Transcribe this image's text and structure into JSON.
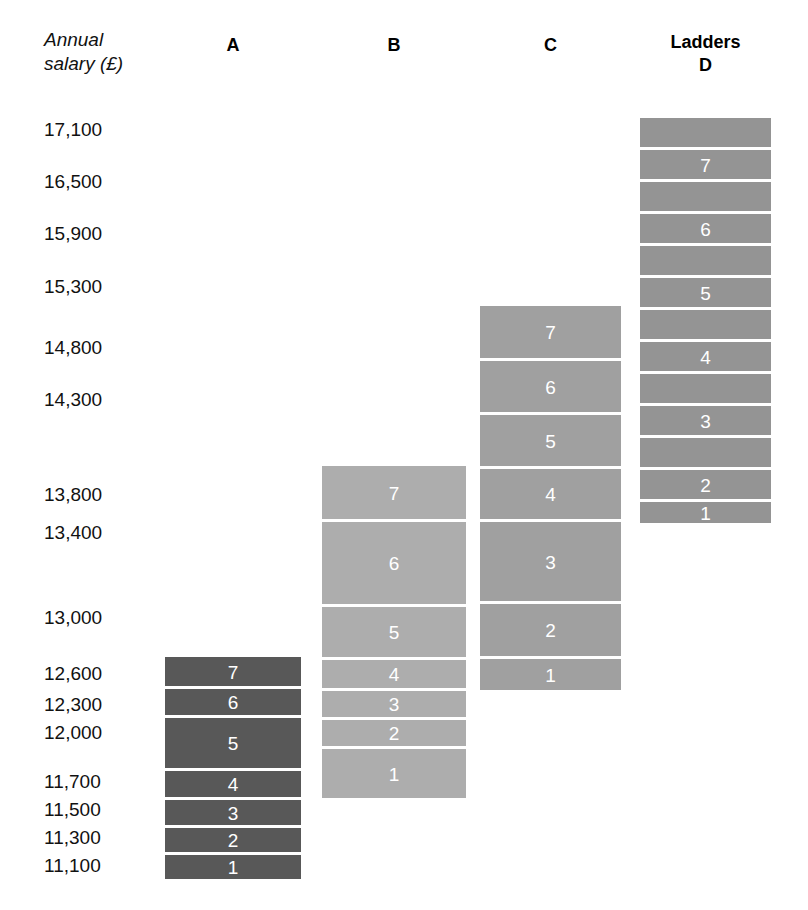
{
  "axis": {
    "title": "Annual\nsalary (£)",
    "tick_labels": [
      "17,100",
      "16,500",
      "15,900",
      "15,300",
      "14,800",
      "14,300",
      "13,800",
      "13,400",
      "13,000",
      "12,600",
      "12,300",
      "12,000",
      "11,700",
      "11,500",
      "11,300",
      "11,100"
    ]
  },
  "headers": {
    "a": "A",
    "b": "B",
    "c": "C",
    "d_top": "Ladders",
    "d_bottom": "D"
  },
  "colors": {
    "ladder_a": "#585858",
    "ladder_b": "#adadad",
    "ladder_c": "#a0a0a0",
    "ladder_d": "#949494",
    "gap": "#ffffff",
    "rung_text": "#ffffff",
    "axis_text": "#111111"
  },
  "chart_data": {
    "type": "bar",
    "title": "",
    "subtitle": "",
    "xlabel": "Ladders",
    "ylabel": "Annual salary (£)",
    "grid": false,
    "legend": "none",
    "ylim": [
      10950,
      17400
    ],
    "ytick_values": [
      17100,
      16500,
      15900,
      15300,
      14800,
      14300,
      13800,
      13400,
      13000,
      12600,
      12300,
      12000,
      11700,
      11500,
      11300,
      11100
    ],
    "ytick_labels": [
      "17,100",
      "16,500",
      "15,900",
      "15,300",
      "14,800",
      "14,300",
      "13,800",
      "13,400",
      "13,000",
      "12,600",
      "12,300",
      "12,000",
      "11,700",
      "11,500",
      "11,300",
      "11,100"
    ],
    "categories": [
      "A",
      "B",
      "C",
      "D"
    ],
    "note": "Each ladder is a stack of 7 numbered increment rungs (1 at bottom to 7 at top); ladder D additionally shows 6 unlabeled spacer bands interleaved between its numbered rungs.",
    "series": [
      {
        "name": "A",
        "color": "#585858",
        "rungs": [
          {
            "point": "1",
            "salary": 11100
          },
          {
            "point": "2",
            "salary": 11300
          },
          {
            "point": "3",
            "salary": 11500
          },
          {
            "point": "4",
            "salary": 11700
          },
          {
            "point": "5",
            "salary": 12000
          },
          {
            "point": "6",
            "salary": 12300
          },
          {
            "point": "7",
            "salary": 12600
          }
        ]
      },
      {
        "name": "B",
        "color": "#adadad",
        "rungs": [
          {
            "point": "1",
            "salary": 11900
          },
          {
            "point": "2",
            "salary": 12150
          },
          {
            "point": "3",
            "salary": 12400
          },
          {
            "point": "4",
            "salary": 12650
          },
          {
            "point": "5",
            "salary": 13000
          },
          {
            "point": "6",
            "salary": 13400
          },
          {
            "point": "7",
            "salary": 13800
          }
        ]
      },
      {
        "name": "C",
        "color": "#a0a0a0",
        "rungs": [
          {
            "point": "1",
            "salary": 12700
          },
          {
            "point": "2",
            "salary": 12950
          },
          {
            "point": "3",
            "salary": 13350
          },
          {
            "point": "4",
            "salary": 13750
          },
          {
            "point": "5",
            "salary": 14050
          },
          {
            "point": "6",
            "salary": 14350
          },
          {
            "point": "7",
            "salary": 14800
          }
        ]
      },
      {
        "name": "D",
        "color": "#949494",
        "rungs": [
          {
            "point": "1",
            "salary": 13400
          },
          {
            "point": "2",
            "salary": 13950
          },
          {
            "point": "3",
            "salary": 14500
          },
          {
            "point": "4",
            "salary": 15000
          },
          {
            "point": "5",
            "salary": 15500
          },
          {
            "point": "6",
            "salary": 16100
          },
          {
            "point": "7",
            "salary": 16750
          }
        ]
      }
    ]
  },
  "ladders": {
    "a": {
      "label": "A",
      "left": 165,
      "width": 136,
      "rungs": [
        {
          "label": "7",
          "top": 657,
          "height": 29
        },
        {
          "label": "6",
          "top": 689,
          "height": 26
        },
        {
          "label": "5",
          "top": 718,
          "height": 50
        },
        {
          "label": "4",
          "top": 771,
          "height": 26
        },
        {
          "label": "3",
          "top": 800,
          "height": 25
        },
        {
          "label": "2",
          "top": 828,
          "height": 24
        },
        {
          "label": "1",
          "top": 855,
          "height": 24
        }
      ]
    },
    "b": {
      "label": "B",
      "left": 322,
      "width": 144,
      "rungs": [
        {
          "label": "7",
          "top": 466,
          "height": 53
        },
        {
          "label": "6",
          "top": 522,
          "height": 82
        },
        {
          "label": "5",
          "top": 607,
          "height": 50
        },
        {
          "label": "4",
          "top": 660,
          "height": 28
        },
        {
          "label": "3",
          "top": 691,
          "height": 26
        },
        {
          "label": "2",
          "top": 720,
          "height": 26
        },
        {
          "label": "1",
          "top": 749,
          "height": 49
        }
      ]
    },
    "c": {
      "label": "C",
      "left": 480,
      "width": 141,
      "rungs": [
        {
          "label": "7",
          "top": 306,
          "height": 52
        },
        {
          "label": "6",
          "top": 361,
          "height": 51
        },
        {
          "label": "5",
          "top": 415,
          "height": 51
        },
        {
          "label": "4",
          "top": 469,
          "height": 50
        },
        {
          "label": "3",
          "top": 522,
          "height": 79
        },
        {
          "label": "2",
          "top": 604,
          "height": 52
        },
        {
          "label": "1",
          "top": 659,
          "height": 31
        }
      ]
    },
    "d": {
      "label": "D",
      "left": 640,
      "width": 131,
      "rungs": [
        {
          "label": "",
          "top": 118,
          "height": 29
        },
        {
          "label": "7",
          "top": 150,
          "height": 29
        },
        {
          "label": "",
          "top": 182,
          "height": 29
        },
        {
          "label": "6",
          "top": 214,
          "height": 29
        },
        {
          "label": "",
          "top": 246,
          "height": 29
        },
        {
          "label": "5",
          "top": 278,
          "height": 29
        },
        {
          "label": "",
          "top": 310,
          "height": 29
        },
        {
          "label": "4",
          "top": 342,
          "height": 29
        },
        {
          "label": "",
          "top": 374,
          "height": 29
        },
        {
          "label": "3",
          "top": 406,
          "height": 29
        },
        {
          "label": "",
          "top": 438,
          "height": 29
        },
        {
          "label": "2",
          "top": 470,
          "height": 29
        },
        {
          "label": "1",
          "top": 502,
          "height": 21
        }
      ]
    }
  },
  "tick_positions": [
    {
      "label": "17,100",
      "top": 120
    },
    {
      "label": "16,500",
      "top": 172
    },
    {
      "label": "15,900",
      "top": 224
    },
    {
      "label": "15,300",
      "top": 277
    },
    {
      "label": "14,800",
      "top": 338
    },
    {
      "label": "14,300",
      "top": 390
    },
    {
      "label": "13,800",
      "top": 485
    },
    {
      "label": "13,400",
      "top": 523
    },
    {
      "label": "13,000",
      "top": 608
    },
    {
      "label": "12,600",
      "top": 664
    },
    {
      "label": "12,300",
      "top": 695
    },
    {
      "label": "12,000",
      "top": 723
    },
    {
      "label": "11,700",
      "top": 772
    },
    {
      "label": "11,500",
      "top": 800
    },
    {
      "label": "11,300",
      "top": 828
    },
    {
      "label": "11,100",
      "top": 856
    }
  ],
  "header_positions": {
    "a": {
      "left": 165,
      "width": 136,
      "top": 34
    },
    "b": {
      "left": 322,
      "width": 144,
      "top": 34
    },
    "c": {
      "left": 480,
      "width": 141,
      "top": 34
    },
    "d": {
      "left": 640,
      "width": 131,
      "top": 31
    }
  }
}
